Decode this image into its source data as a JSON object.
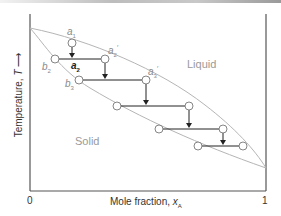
{
  "diagram": {
    "type": "phase-diagram-zone-refining",
    "regions": {
      "liquid": "Liquid",
      "solid": "Solid"
    },
    "x_axis": {
      "title": "Mole fraction, ",
      "var": "x",
      "sub": "A",
      "tick_min": "0",
      "tick_max": "1"
    },
    "y_axis": {
      "title": "Temperature, ",
      "var": "T",
      "arrow": "⟶"
    },
    "point_labels": {
      "a1": {
        "base": "a",
        "sub": "1",
        "prime": ""
      },
      "a2": {
        "base": "a",
        "sub": "2",
        "prime": ""
      },
      "a2p": {
        "base": "a",
        "sub": "2",
        "prime": "′"
      },
      "a3p": {
        "base": "a",
        "sub": "3",
        "prime": "′"
      },
      "b2": {
        "base": "b",
        "sub": "2",
        "prime": ""
      },
      "b3": {
        "base": "b",
        "sub": "3",
        "prime": ""
      }
    },
    "curves": {
      "liquidus_color": "#b5b5b5",
      "solidus_color": "#b5b5b5",
      "tie_line_color": "#222222",
      "axis_color": "#555555"
    },
    "steps": [
      {
        "solidus": [
          55,
          59
        ],
        "liquidus": [
          105,
          59
        ],
        "drop_from": [
          72,
          43
        ]
      },
      {
        "solidus": [
          79,
          80
        ],
        "liquidus": [
          146,
          80
        ],
        "drop_from": [
          105,
          59
        ]
      },
      {
        "solidus": [
          117,
          106
        ],
        "liquidus": [
          189,
          106
        ],
        "drop_from": [
          146,
          80
        ]
      },
      {
        "solidus": [
          159,
          129
        ],
        "liquidus": [
          223,
          129
        ],
        "drop_from": [
          189,
          106
        ]
      },
      {
        "solidus": [
          198,
          146
        ],
        "liquidus": [
          243,
          146
        ],
        "drop_from": [
          223,
          129
        ]
      }
    ]
  }
}
